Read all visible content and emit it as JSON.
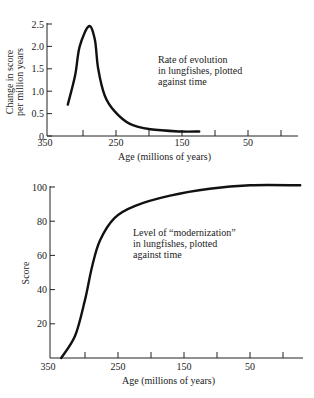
{
  "chart_data": [
    {
      "type": "line",
      "title": "",
      "annotation": [
        "Rate of evolution",
        "in lungfishes, plotted",
        "against time"
      ],
      "xlabel": "Age (millions of years)",
      "ylabel": [
        "Change in score",
        "per million years"
      ],
      "x_reversed": true,
      "xlim": [
        350,
        0
      ],
      "ylim": [
        0,
        2.5
      ],
      "x_ticks": [
        350,
        300,
        250,
        200,
        150,
        100,
        50,
        0
      ],
      "x_tick_labels": [
        "350",
        "",
        "250",
        "",
        "150",
        "",
        "50",
        ""
      ],
      "y_ticks": [
        0,
        0.5,
        1.0,
        1.5,
        2.0,
        2.5
      ],
      "y_tick_labels": [
        "0",
        "0.5",
        "1.0",
        "1.5",
        "2.0",
        "2.5"
      ],
      "grid": false,
      "legend": null,
      "series": [
        {
          "name": "Rate of evolution",
          "x": [
            323,
            312,
            305,
            291,
            282,
            277,
            267,
            252,
            229,
            198,
            153,
            124
          ],
          "y": [
            0.7,
            1.35,
            2.0,
            2.45,
            2.15,
            1.5,
            0.9,
            0.55,
            0.27,
            0.15,
            0.1,
            0.1
          ]
        }
      ]
    },
    {
      "type": "line",
      "title": "",
      "annotation": [
        "Level of “modernization”",
        "in lungfishes, plotted",
        "against time"
      ],
      "xlabel": "Age (millions of years)",
      "ylabel": [
        "Score"
      ],
      "x_reversed": true,
      "xlim": [
        350,
        0
      ],
      "ylim": [
        0,
        100
      ],
      "x_ticks": [
        350,
        300,
        250,
        200,
        150,
        100,
        50,
        0
      ],
      "x_tick_labels": [
        "350",
        "",
        "250",
        "",
        "150",
        "",
        "50",
        ""
      ],
      "y_ticks": [
        0,
        20,
        40,
        60,
        80,
        100
      ],
      "y_tick_labels": [
        "",
        "20",
        "40",
        "60",
        "80",
        "100"
      ],
      "grid": false,
      "legend": null,
      "series": [
        {
          "name": "Level of modernization",
          "x": [
            336,
            315,
            300,
            289,
            277,
            255,
            224,
            171,
            111,
            50,
            -26
          ],
          "y": [
            0,
            13,
            34,
            54,
            69,
            82,
            89,
            95,
            99,
            101,
            101
          ]
        }
      ]
    }
  ]
}
